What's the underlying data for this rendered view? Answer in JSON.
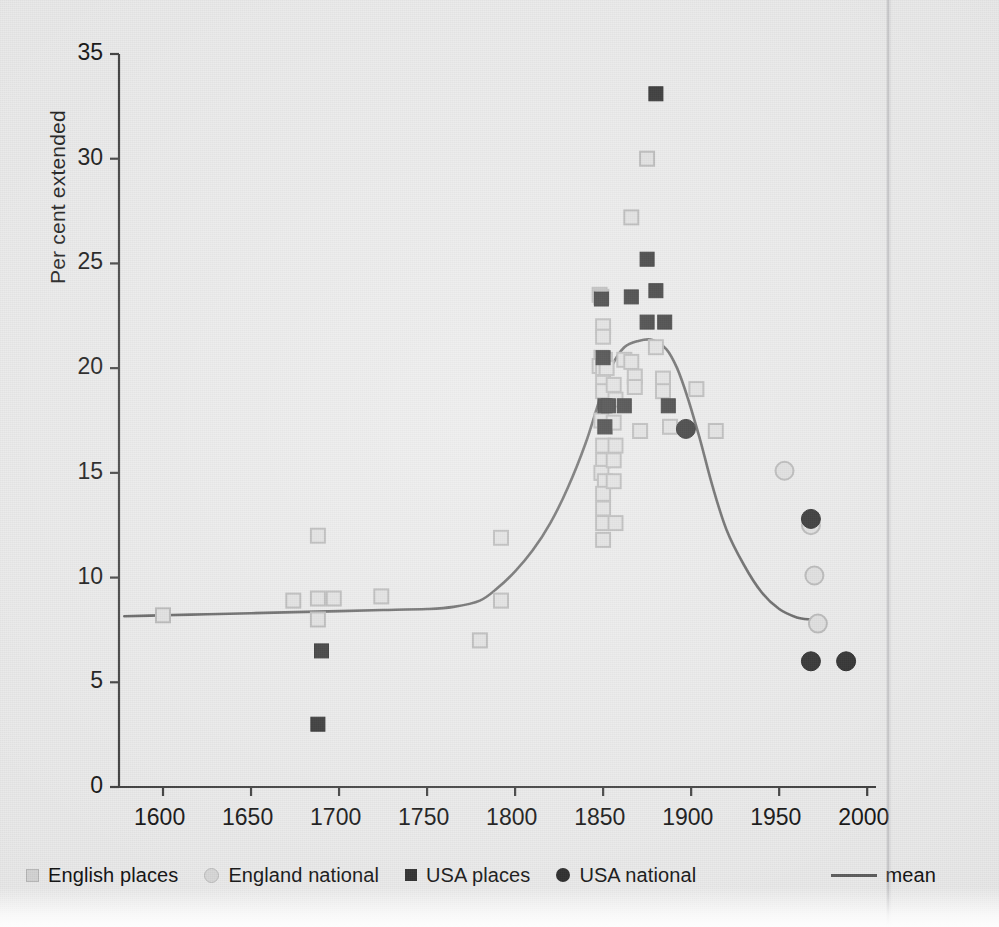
{
  "figure": {
    "ylabel": "Per cent extended",
    "background_color": "#e9e9e9",
    "ink_color": "#111111"
  },
  "legend": {
    "items": [
      {
        "key": "english_places",
        "label": "English places",
        "marker": "square-light",
        "color": "#d0d0d0"
      },
      {
        "key": "england_national",
        "label": "England national",
        "marker": "circle-light",
        "color": "#d4d4d4"
      },
      {
        "key": "usa_places",
        "label": "USA places",
        "marker": "square-dark",
        "color": "#2a2a2a"
      },
      {
        "key": "usa_national",
        "label": "USA national",
        "marker": "circle-dark",
        "color": "#242424"
      },
      {
        "key": "mean",
        "label": "mean",
        "marker": "line",
        "color": "#5d5d5d"
      }
    ]
  },
  "chart_data": {
    "type": "scatter",
    "title": "",
    "xlabel": "",
    "ylabel": "Per cent extended",
    "xlim": [
      1575,
      2005
    ],
    "ylim": [
      0,
      35
    ],
    "xticks": [
      1600,
      1650,
      1700,
      1750,
      1800,
      1850,
      1900,
      1950,
      2000
    ],
    "xtick_labels": [
      "1600",
      "1650",
      "1700",
      "1750",
      "1800",
      "1850",
      "1900",
      "1950",
      "2000"
    ],
    "yticks": [
      0,
      5,
      10,
      15,
      20,
      25,
      30,
      35
    ],
    "ytick_labels": [
      "0",
      "5",
      "10",
      "15",
      "20",
      "25",
      "30",
      "35"
    ],
    "grid": false,
    "legend_position": "below-axes",
    "series": [
      {
        "name": "English places",
        "marker": "square-light",
        "color": "#d0d0d0",
        "points": [
          [
            1600,
            8.2
          ],
          [
            1674,
            8.9
          ],
          [
            1688,
            9.0
          ],
          [
            1688,
            8.0
          ],
          [
            1688,
            12.0
          ],
          [
            1697,
            9.0
          ],
          [
            1724,
            9.1
          ],
          [
            1780,
            7.0
          ],
          [
            1792,
            11.9
          ],
          [
            1792,
            8.9
          ],
          [
            1848,
            23.5
          ],
          [
            1849,
            23.4
          ],
          [
            1850,
            22.0
          ],
          [
            1850,
            21.5
          ],
          [
            1849,
            20.5
          ],
          [
            1851,
            20.4
          ],
          [
            1848,
            20.1
          ],
          [
            1850,
            20.0
          ],
          [
            1852,
            20.0
          ],
          [
            1850,
            19.3
          ],
          [
            1850,
            18.9
          ],
          [
            1849,
            17.5
          ],
          [
            1851,
            17.2
          ],
          [
            1850,
            16.3
          ],
          [
            1850,
            15.6
          ],
          [
            1849,
            15.0
          ],
          [
            1851,
            14.6
          ],
          [
            1850,
            14.0
          ],
          [
            1850,
            13.3
          ],
          [
            1850,
            12.6
          ],
          [
            1850,
            11.8
          ],
          [
            1856,
            19.2
          ],
          [
            1857,
            18.5
          ],
          [
            1856,
            17.4
          ],
          [
            1857,
            16.3
          ],
          [
            1856,
            15.6
          ],
          [
            1856,
            14.6
          ],
          [
            1857,
            12.6
          ],
          [
            1862,
            20.4
          ],
          [
            1866,
            27.2
          ],
          [
            1866,
            20.3
          ],
          [
            1868,
            19.6
          ],
          [
            1868,
            19.1
          ],
          [
            1875,
            30.0
          ],
          [
            1871,
            17.0
          ],
          [
            1880,
            21.0
          ],
          [
            1884,
            19.5
          ],
          [
            1884,
            18.9
          ],
          [
            1888,
            17.2
          ],
          [
            1903,
            19.0
          ],
          [
            1914,
            17.0
          ]
        ]
      },
      {
        "name": "England national",
        "marker": "circle-light",
        "color": "#d4d4d4",
        "points": [
          [
            1953,
            15.1
          ],
          [
            1968,
            12.5
          ],
          [
            1970,
            10.1
          ],
          [
            1972,
            7.8
          ]
        ]
      },
      {
        "name": "USA places",
        "marker": "square-dark",
        "color": "#2a2a2a",
        "points": [
          [
            1688,
            3.0
          ],
          [
            1690,
            6.5
          ],
          [
            1849,
            23.3
          ],
          [
            1850,
            20.5
          ],
          [
            1851,
            18.2
          ],
          [
            1851,
            17.2
          ],
          [
            1853,
            18.2
          ],
          [
            1862,
            18.2
          ],
          [
            1866,
            23.4
          ],
          [
            1875,
            25.2
          ],
          [
            1875,
            22.2
          ],
          [
            1880,
            33.1
          ],
          [
            1880,
            23.7
          ],
          [
            1885,
            22.2
          ],
          [
            1887,
            18.2
          ]
        ]
      },
      {
        "name": "USA national",
        "marker": "circle-dark",
        "color": "#242424",
        "points": [
          [
            1897,
            17.1
          ],
          [
            1968,
            12.8
          ],
          [
            1968,
            6.0
          ],
          [
            1988,
            6.0
          ]
        ]
      }
    ],
    "mean_curve": {
      "name": "mean",
      "color": "#5d5d5d",
      "points": [
        [
          1578,
          8.15
        ],
        [
          1600,
          8.2
        ],
        [
          1625,
          8.25
        ],
        [
          1650,
          8.3
        ],
        [
          1675,
          8.35
        ],
        [
          1700,
          8.4
        ],
        [
          1725,
          8.45
        ],
        [
          1750,
          8.5
        ],
        [
          1765,
          8.6
        ],
        [
          1780,
          8.9
        ],
        [
          1790,
          9.5
        ],
        [
          1800,
          10.3
        ],
        [
          1810,
          11.3
        ],
        [
          1820,
          12.6
        ],
        [
          1830,
          14.3
        ],
        [
          1840,
          16.4
        ],
        [
          1848,
          18.5
        ],
        [
          1855,
          20.1
        ],
        [
          1862,
          21.0
        ],
        [
          1870,
          21.3
        ],
        [
          1878,
          21.35
        ],
        [
          1886,
          20.9
        ],
        [
          1892,
          20.0
        ],
        [
          1898,
          18.6
        ],
        [
          1905,
          16.6
        ],
        [
          1912,
          14.4
        ],
        [
          1920,
          12.3
        ],
        [
          1930,
          10.6
        ],
        [
          1940,
          9.3
        ],
        [
          1950,
          8.5
        ],
        [
          1960,
          8.1
        ],
        [
          1968,
          8.0
        ]
      ]
    }
  }
}
